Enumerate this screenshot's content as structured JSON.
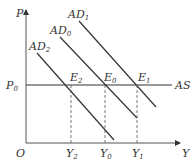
{
  "diagram": {
    "axes": {
      "y_label": "P",
      "x_label": "Y",
      "origin_label": "O"
    },
    "price_level": {
      "label": "P",
      "sub": "0"
    },
    "supply_curve": {
      "label": "AS"
    },
    "demand_curves": [
      {
        "label": "AD",
        "sub": "2"
      },
      {
        "label": "AD",
        "sub": "0"
      },
      {
        "label": "AD",
        "sub": "1"
      }
    ],
    "equilibria": [
      {
        "label": "E",
        "sub": "2"
      },
      {
        "label": "E",
        "sub": "0"
      },
      {
        "label": "E",
        "sub": "1"
      }
    ],
    "output_levels": [
      {
        "label": "Y",
        "sub": "2"
      },
      {
        "label": "Y",
        "sub": "0"
      },
      {
        "label": "Y",
        "sub": "1"
      }
    ],
    "colors": {
      "line": "#333333",
      "axis": "#555555",
      "dash": "#555555"
    }
  }
}
